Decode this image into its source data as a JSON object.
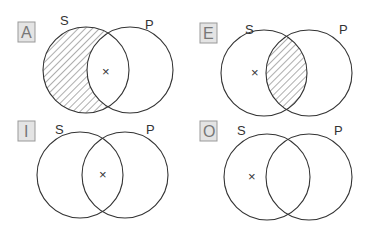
{
  "panels": [
    {
      "id": "A",
      "s_label": "S",
      "p_label": "P",
      "mark": "×"
    },
    {
      "id": "E",
      "s_label": "S",
      "p_label": "P",
      "mark": "×"
    },
    {
      "id": "I",
      "s_label": "S",
      "p_label": "P",
      "mark": "×"
    },
    {
      "id": "O",
      "s_label": "S",
      "p_label": "P",
      "mark": "×"
    }
  ]
}
